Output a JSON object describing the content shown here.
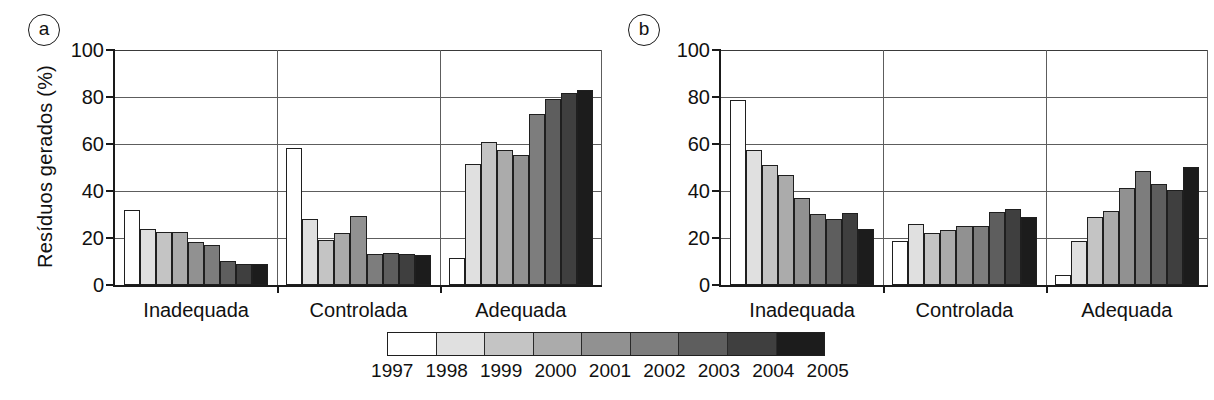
{
  "figure": {
    "panels": [
      {
        "tag": "a",
        "ylabel": "Resíduos gerados (%)",
        "yticks": [
          "0",
          "20",
          "40",
          "60",
          "80",
          "100"
        ],
        "categories": [
          "Inadequada",
          "Controlada",
          "Adequada"
        ]
      },
      {
        "tag": "b",
        "ylabel": "Municípios (%)",
        "yticks": [
          "0",
          "20",
          "40",
          "60",
          "80",
          "100"
        ],
        "categories": [
          "Inadequada",
          "Controlada",
          "Adequada"
        ]
      }
    ]
  },
  "legend": {
    "years": [
      "1997",
      "1998",
      "1999",
      "2000",
      "2001",
      "2002",
      "2003",
      "2004",
      "2005"
    ],
    "colors": [
      "#ffffff",
      "#e0e0e0",
      "#c4c4c4",
      "#ababab",
      "#919191",
      "#7d7d7d",
      "#5e5e5e",
      "#3f3f3f",
      "#1c1c1c"
    ]
  },
  "chart_data": [
    {
      "type": "bar",
      "title": "(a) Resíduos gerados por tipo de destinação",
      "panel": "a",
      "xlabel": "",
      "ylabel": "Resíduos gerados (%)",
      "ylim": [
        0,
        100
      ],
      "yticks": [
        0,
        20,
        40,
        60,
        80,
        100
      ],
      "grid": true,
      "legend_position": "bottom",
      "categories": [
        "Inadequada",
        "Controlada",
        "Adequada"
      ],
      "series": [
        {
          "name": "1997",
          "color": "#ffffff",
          "values": [
            31.8,
            58.3,
            11.3
          ]
        },
        {
          "name": "1998",
          "color": "#e0e0e0",
          "values": [
            23.9,
            28.0,
            51.5
          ]
        },
        {
          "name": "1999",
          "color": "#c4c4c4",
          "values": [
            22.5,
            19.0,
            60.7
          ]
        },
        {
          "name": "2000",
          "color": "#ababab",
          "values": [
            22.4,
            22.1,
            57.4
          ]
        },
        {
          "name": "2001",
          "color": "#919191",
          "values": [
            18.1,
            29.3,
            55.4
          ]
        },
        {
          "name": "2002",
          "color": "#7d7d7d",
          "values": [
            17.0,
            13.4,
            72.8
          ]
        },
        {
          "name": "2003",
          "color": "#5e5e5e",
          "values": [
            10.4,
            13.6,
            79.2
          ]
        },
        {
          "name": "2004",
          "color": "#3f3f3f",
          "values": [
            9.0,
            13.3,
            81.6
          ]
        },
        {
          "name": "2005",
          "color": "#1c1c1c",
          "values": [
            8.9,
            12.9,
            82.8
          ]
        }
      ]
    },
    {
      "type": "bar",
      "title": "(b) Municípios por tipo de destinação",
      "panel": "b",
      "xlabel": "",
      "ylabel": "Municípios (%)",
      "ylim": [
        0,
        100
      ],
      "yticks": [
        0,
        20,
        40,
        60,
        80,
        100
      ],
      "grid": true,
      "legend_position": "bottom",
      "categories": [
        "Inadequada",
        "Controlada",
        "Adequada"
      ],
      "series": [
        {
          "name": "1997",
          "color": "#ffffff",
          "values": [
            78.8,
            18.6,
            4.4
          ]
        },
        {
          "name": "1998",
          "color": "#e0e0e0",
          "values": [
            57.3,
            26.0,
            18.8
          ]
        },
        {
          "name": "1999",
          "color": "#c4c4c4",
          "values": [
            51.0,
            22.1,
            28.9
          ]
        },
        {
          "name": "2000",
          "color": "#ababab",
          "values": [
            46.8,
            23.3,
            31.5
          ]
        },
        {
          "name": "2001",
          "color": "#919191",
          "values": [
            37.2,
            25.3,
            41.3
          ]
        },
        {
          "name": "2002",
          "color": "#7d7d7d",
          "values": [
            30.3,
            25.2,
            48.4
          ]
        },
        {
          "name": "2003",
          "color": "#5e5e5e",
          "values": [
            28.3,
            31.0,
            43.0
          ]
        },
        {
          "name": "2004",
          "color": "#3f3f3f",
          "values": [
            30.7,
            32.3,
            40.6
          ]
        },
        {
          "name": "2005",
          "color": "#1c1c1c",
          "values": [
            23.8,
            29.0,
            50.4
          ]
        }
      ]
    }
  ]
}
